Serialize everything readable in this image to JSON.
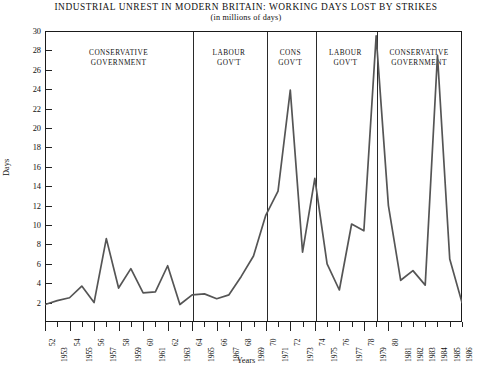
{
  "chart_data": {
    "type": "line",
    "title": "INDUSTRIAL UNREST IN MODERN BRITAIN: WORKING DAYS LOST BY STRIKES",
    "subtitle": "(in millions of days)",
    "xlabel": "Years",
    "ylabel": "Days",
    "ylim": [
      0,
      30
    ],
    "ytick_step": 2,
    "grid": false,
    "legend": "none",
    "x": [
      1952,
      1953,
      1954,
      1955,
      1956,
      1957,
      1958,
      1959,
      1960,
      1961,
      1962,
      1963,
      1964,
      1965,
      1966,
      1967,
      1968,
      1969,
      1970,
      1971,
      1972,
      1973,
      1974,
      1975,
      1976,
      1977,
      1978,
      1979,
      1980,
      1981,
      1982,
      1983,
      1984,
      1985,
      1986
    ],
    "values": [
      1.8,
      2.2,
      2.5,
      3.7,
      2.0,
      8.6,
      3.5,
      5.5,
      3.0,
      3.1,
      5.8,
      1.8,
      2.8,
      2.9,
      2.4,
      2.8,
      4.7,
      6.8,
      11.0,
      13.5,
      23.9,
      7.2,
      14.8,
      6.0,
      3.3,
      10.1,
      9.4,
      29.5,
      12.0,
      4.3,
      5.3,
      3.8,
      27.5,
      6.5,
      2.0
    ],
    "series_color": "#555555",
    "x_tick_labels": [
      "52",
      "1953",
      "54",
      "1955",
      "56",
      "1957",
      "58",
      "1959",
      "60",
      "1961",
      "62",
      "1963",
      "64",
      "1965",
      "66",
      "1967",
      "68",
      "1969",
      "70",
      "1971",
      "72",
      "1973",
      "74",
      "1975",
      "76",
      "1977",
      "78",
      "1979",
      "80",
      "1981",
      "1982",
      "1983",
      "1984",
      "1985",
      "1986"
    ],
    "y_tick_labels": [
      "2",
      "4",
      "6",
      "8",
      "10",
      "12",
      "14",
      "16",
      "18",
      "20",
      "22",
      "24",
      "26",
      "28",
      "30"
    ],
    "annotations": [
      {
        "name": "conservative-government-1",
        "label_line1": "CONSERVATIVE",
        "label_line2": "GOVERNMENT",
        "start_year": 1952,
        "end_year": 1964
      },
      {
        "name": "labour-government-1",
        "label_line1": "LABOUR",
        "label_line2": "GOV'T",
        "start_year": 1964,
        "end_year": 1970
      },
      {
        "name": "conservative-government-2",
        "label_line1": "CONS",
        "label_line2": "GOV'T",
        "start_year": 1970,
        "end_year": 1974
      },
      {
        "name": "labour-government-2",
        "label_line1": "LABOUR",
        "label_line2": "GOV'T",
        "start_year": 1974,
        "end_year": 1979
      },
      {
        "name": "conservative-government-3",
        "label_line1": "CONSERVATIVE",
        "label_line2": "GOVERNMENT",
        "start_year": 1979,
        "end_year": 1986
      }
    ]
  }
}
